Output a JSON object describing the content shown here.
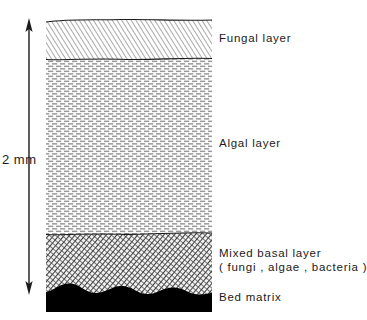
{
  "figure": {
    "title_remnant": "",
    "scale": {
      "label": "2 mm",
      "arrow_name": "double-headed-vertical-arrow"
    },
    "layers": [
      {
        "id": "fungal",
        "label": "Fungal layer",
        "texture": "diagonal-hatch",
        "color": "#8d8d8d"
      },
      {
        "id": "algal",
        "label": "Algal layer",
        "texture": "horizontal-dash-brick",
        "color": "#9a9a9a"
      },
      {
        "id": "mixed_basal",
        "label": "Mixed basal layer",
        "sublabel": "( fungi , algae , bacteria )",
        "texture": "dense-cross-hatch",
        "color": "#4a4a4a"
      },
      {
        "id": "bed_matrix",
        "label": "Bed matrix",
        "texture": "solid-scalloped",
        "color": "#000000"
      }
    ]
  }
}
